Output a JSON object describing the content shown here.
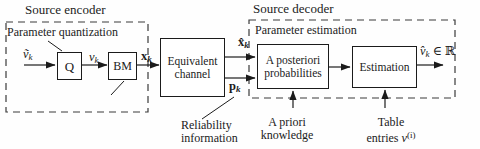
{
  "figure": {
    "encoder": {
      "title": "Source encoder",
      "box_label": "Parameter quantization",
      "q_box": "Q",
      "bm_box": "BM",
      "bit_mapping": "Bit mapping"
    },
    "channel": {
      "line1": "Equivalent",
      "line2": "channel"
    },
    "decoder": {
      "title": "Source decoder",
      "box_label": "Parameter estimation",
      "apost_line1": "A posteriori",
      "apost_line2": "probabilities",
      "estimation": "Estimation"
    },
    "signals": {
      "input_base": "ṽ",
      "input_sub": "k",
      "quantized_base": "v",
      "quantized_sub": "k",
      "bits_base": "x",
      "bits_sub": "k",
      "received_base": "x̂",
      "received_sub": "k",
      "reliability_base": "p",
      "reliability_sub": "k",
      "output_base": "v̂",
      "output_sub": "k",
      "output_suffix": " ∈ ℝ"
    },
    "annotations": {
      "reliability_line1": "Reliability",
      "reliability_line2": "information",
      "apriori_line1": "A priori",
      "apriori_line2": "knowledge",
      "table_line1": "Table",
      "table_line2_prefix": "entries ",
      "table_base": "v",
      "table_sup": "(i)"
    },
    "colors": {
      "ink": "#1b1b1b",
      "dash": "#3a3a3a",
      "background": "#fefefe"
    }
  }
}
